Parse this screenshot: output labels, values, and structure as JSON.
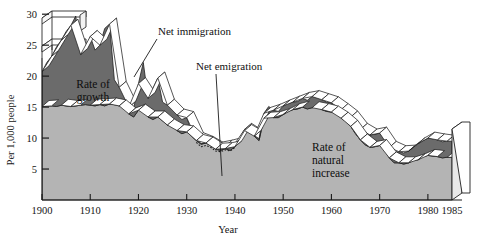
{
  "chart_data": {
    "type": "area",
    "title": "",
    "subtitle": "",
    "xlabel": "Year",
    "ylabel": "Per 1,000 people",
    "xlim": [
      1900,
      1985
    ],
    "ylim": [
      0,
      31
    ],
    "grid": false,
    "legend_position": "inline-annotations",
    "xticks": [
      1900,
      1910,
      1920,
      1930,
      1940,
      1950,
      1960,
      1970,
      1980,
      1985
    ],
    "xtick_labels": [
      "1900",
      "1910",
      "1920",
      "1930",
      "1940",
      "1950",
      "1960",
      "1970",
      "1980",
      "1985"
    ],
    "yticks": [
      5,
      10,
      15,
      20,
      25,
      30
    ],
    "ytick_labels": [
      "5",
      "10",
      "15",
      "20",
      "25",
      "30"
    ],
    "x": [
      1900,
      1901,
      1902,
      1903,
      1904,
      1905,
      1906,
      1907,
      1908,
      1909,
      1910,
      1911,
      1912,
      1913,
      1914,
      1915,
      1916,
      1917,
      1918,
      1919,
      1920,
      1921,
      1922,
      1923,
      1924,
      1925,
      1926,
      1927,
      1928,
      1929,
      1930,
      1931,
      1932,
      1933,
      1934,
      1935,
      1936,
      1937,
      1938,
      1939,
      1940,
      1941,
      1942,
      1943,
      1944,
      1945,
      1946,
      1947,
      1948,
      1949,
      1950,
      1951,
      1952,
      1953,
      1954,
      1955,
      1956,
      1957,
      1958,
      1959,
      1960,
      1961,
      1962,
      1963,
      1964,
      1965,
      1966,
      1967,
      1968,
      1969,
      1970,
      1971,
      1972,
      1973,
      1974,
      1975,
      1976,
      1977,
      1978,
      1979,
      1980,
      1981,
      1982,
      1983,
      1984,
      1985
    ],
    "series": [
      {
        "name": "Rate of natural increase",
        "color": "#b4b4b4",
        "values": [
          15.1,
          15.2,
          15.2,
          15.1,
          15.3,
          15.2,
          15.1,
          15.2,
          15.3,
          15.4,
          15.3,
          15.2,
          15.4,
          15.2,
          15.5,
          15.4,
          15.2,
          14.8,
          13.9,
          13.4,
          14.5,
          14.7,
          13.4,
          13.0,
          13.4,
          12.8,
          12.1,
          12.0,
          11.2,
          10.7,
          11.0,
          10.3,
          9.6,
          9.0,
          9.2,
          8.8,
          8.2,
          8.0,
          8.3,
          8.0,
          8.6,
          9.7,
          11.2,
          11.3,
          10.3,
          9.6,
          13.2,
          14.1,
          13.3,
          13.3,
          13.8,
          14.3,
          14.6,
          14.7,
          15.0,
          14.7,
          14.9,
          15.1,
          14.6,
          14.3,
          14.2,
          14.0,
          13.2,
          12.7,
          11.9,
          10.7,
          9.7,
          8.9,
          8.5,
          8.6,
          8.8,
          8.1,
          6.8,
          6.0,
          6.0,
          5.8,
          6.0,
          6.4,
          6.5,
          7.0,
          7.2,
          7.1,
          7.0,
          6.8,
          6.9,
          6.9
        ]
      },
      {
        "name": "Net immigration",
        "color": "#6b6b6b",
        "values": [
          5.6,
          7.0,
          8.0,
          9.6,
          10.5,
          12.0,
          13.1,
          14.5,
          8.2,
          8.7,
          11.1,
          9.0,
          9.6,
          12.5,
          12.9,
          4.0,
          3.0,
          2.4,
          1.1,
          1.3,
          4.3,
          7.5,
          3.0,
          5.0,
          6.3,
          3.0,
          3.2,
          3.0,
          2.5,
          2.3,
          2.3,
          0.8,
          0.3,
          0.1,
          0.1,
          0.2,
          0.2,
          0.3,
          0.4,
          0.5,
          0.5,
          0.4,
          0.2,
          0.1,
          0.1,
          0.3,
          0.8,
          1.0,
          1.2,
          1.0,
          1.4,
          1.3,
          1.2,
          1.2,
          1.4,
          1.4,
          1.8,
          1.9,
          1.6,
          1.5,
          1.5,
          1.5,
          1.4,
          1.5,
          1.5,
          1.5,
          1.7,
          1.8,
          2.0,
          2.0,
          2.0,
          1.8,
          1.7,
          1.7,
          1.8,
          1.8,
          1.9,
          2.2,
          2.6,
          2.6,
          2.8,
          2.8,
          2.7,
          2.6,
          2.6,
          2.6
        ]
      }
    ],
    "dotted_segment": {
      "name": "Net emigration",
      "note": "dotted line below rate of natural increase, c.1932-1940",
      "x": [
        1932,
        1933,
        1934,
        1935,
        1936,
        1937,
        1938,
        1939,
        1940
      ],
      "values": [
        -0.3,
        -0.4,
        -0.4,
        -0.3,
        -0.3,
        -0.2,
        -0.2,
        -0.1,
        -0.1
      ]
    },
    "band_labels": [
      {
        "id": "rate-of-growth",
        "lines": [
          "Rate of",
          "growth"
        ],
        "x": 1919,
        "y": 21
      },
      {
        "id": "rate-of-natural-increase",
        "lines": [
          "Rate of",
          "natural",
          "increase"
        ],
        "x": 1957,
        "y": 7.2
      }
    ],
    "annotations": [
      {
        "id": "net-immigration",
        "label": "Net immigration",
        "x": 1932,
        "y": 29.2
      },
      {
        "id": "net-emigration",
        "label": "Net emigration",
        "x": 1939,
        "y": 23.5
      }
    ]
  }
}
